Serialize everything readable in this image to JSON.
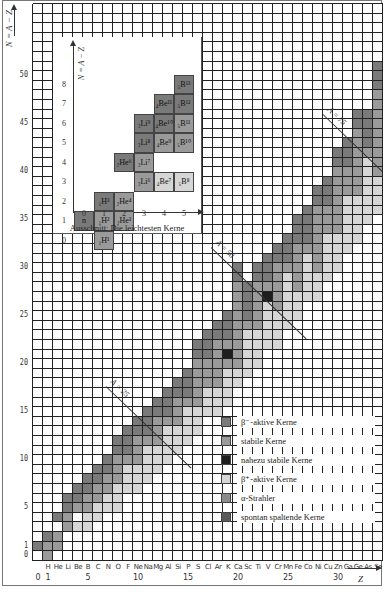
{
  "axes": {
    "y_label": "N = A − Z",
    "x_label": "Z",
    "y_ticks": [
      0,
      1,
      5,
      10,
      15,
      20,
      25,
      30,
      35,
      40,
      45,
      50
    ],
    "x_numbers": [
      0,
      1,
      5,
      10,
      15,
      20,
      25,
      30
    ],
    "x_elements": [
      "",
      "H",
      "He",
      "Li",
      "Be",
      "B",
      "C",
      "N",
      "O",
      "F",
      "Ne",
      "Na",
      "Mg",
      "Al",
      "Si",
      "P",
      "S",
      "Cl",
      "Ar",
      "K",
      "Ca",
      "Sc",
      "Ti",
      "V",
      "Cr",
      "Mn",
      "Fe",
      "Co",
      "Ni",
      "Cu",
      "Zn",
      "Ga",
      "Ge",
      "As",
      "Se"
    ]
  },
  "isobar_lines": [
    {
      "label": "A = 25"
    },
    {
      "label": "A = 50"
    },
    {
      "label": "A = 75"
    }
  ],
  "inset": {
    "caption": "Ausschnitt: Die leichtesten Kerne",
    "y_label": "N = A − Z",
    "x_ticks": [
      0,
      1,
      2,
      3,
      4,
      5
    ],
    "y_ticks": [
      0,
      1,
      2,
      3,
      4,
      5,
      6,
      7,
      8
    ],
    "nuclides": [
      {
        "z": 0,
        "n": 1,
        "label": "n",
        "type": "beta_minus"
      },
      {
        "z": 1,
        "n": 0,
        "label": "₁H¹",
        "type": "stable"
      },
      {
        "z": 1,
        "n": 1,
        "label": "₁H²",
        "type": "stable"
      },
      {
        "z": 1,
        "n": 2,
        "label": "₁H³",
        "type": "beta_minus"
      },
      {
        "z": 2,
        "n": 1,
        "label": "₂He³",
        "type": "stable"
      },
      {
        "z": 2,
        "n": 2,
        "label": "₂He⁴",
        "type": "stable"
      },
      {
        "z": 2,
        "n": 4,
        "label": "₂He⁶",
        "type": "beta_minus"
      },
      {
        "z": 3,
        "n": 3,
        "label": "₃Li⁶",
        "type": "stable"
      },
      {
        "z": 3,
        "n": 4,
        "label": "₃Li⁷",
        "type": "stable"
      },
      {
        "z": 3,
        "n": 5,
        "label": "₃Li⁸",
        "type": "beta_minus"
      },
      {
        "z": 3,
        "n": 6,
        "label": "₃Li⁹",
        "type": "beta_minus"
      },
      {
        "z": 4,
        "n": 3,
        "label": "₄Be⁷",
        "type": "beta_plus"
      },
      {
        "z": 4,
        "n": 5,
        "label": "₄Be⁹",
        "type": "stable"
      },
      {
        "z": 4,
        "n": 6,
        "label": "₄Be¹⁰",
        "type": "beta_minus"
      },
      {
        "z": 4,
        "n": 7,
        "label": "₄Be¹¹",
        "type": "beta_minus"
      },
      {
        "z": 5,
        "n": 3,
        "label": "₅B⁸",
        "type": "beta_plus"
      },
      {
        "z": 5,
        "n": 5,
        "label": "₅B¹⁰",
        "type": "stable"
      },
      {
        "z": 5,
        "n": 6,
        "label": "₅B¹¹",
        "type": "stable"
      },
      {
        "z": 5,
        "n": 7,
        "label": "₅B¹²",
        "type": "beta_minus"
      },
      {
        "z": 5,
        "n": 8,
        "label": "₅B¹³",
        "type": "beta_minus"
      }
    ]
  },
  "legend": [
    {
      "key": "beta_minus",
      "label": "β⁻-aktive Kerne",
      "color": "#7a7a7a"
    },
    {
      "key": "stable",
      "label": "stabile Kerne",
      "color": "#9a9a9a"
    },
    {
      "key": "nearly_stable",
      "label": "nahezu stabile Kerne",
      "color": "#1e1e1e"
    },
    {
      "key": "beta_plus",
      "label": "β⁺-aktive Kerne",
      "color": "#d6d6d6"
    },
    {
      "key": "alpha",
      "label": "α-Strahler",
      "color": "#8c8c8c"
    },
    {
      "key": "fission",
      "label": "spontan spaltende Kerne",
      "color": "#5a5a5a"
    }
  ],
  "chart_data": {
    "type": "heatmap",
    "xlabel": "Z",
    "ylabel": "N = A − Z",
    "xlim": [
      0,
      34
    ],
    "ylim": [
      0,
      57
    ],
    "grid": true,
    "bands": [
      {
        "z": 0,
        "beta_plus": [],
        "stable": [],
        "beta_minus": [
          1,
          1
        ]
      },
      {
        "z": 1,
        "beta_plus": [],
        "stable": [
          0,
          1
        ],
        "beta_minus": [
          2,
          2
        ]
      },
      {
        "z": 2,
        "beta_plus": [],
        "stable": [
          1,
          2
        ],
        "beta_minus": [
          4,
          4
        ]
      },
      {
        "z": 3,
        "beta_plus": [],
        "stable": [
          3,
          4
        ],
        "beta_minus": [
          5,
          6
        ]
      },
      {
        "z": 4,
        "beta_plus": [
          3,
          3
        ],
        "stable": [
          5,
          5
        ],
        "beta_minus": [
          6,
          7
        ]
      },
      {
        "z": 5,
        "beta_plus": [
          3,
          4
        ],
        "stable": [
          5,
          6
        ],
        "beta_minus": [
          7,
          8
        ]
      },
      {
        "z": 6,
        "beta_plus": [
          4,
          5
        ],
        "stable": [
          6,
          7
        ],
        "beta_minus": [
          8,
          9
        ]
      },
      {
        "z": 7,
        "beta_plus": [
          5,
          6
        ],
        "stable": [
          7,
          8
        ],
        "beta_minus": [
          9,
          10
        ]
      },
      {
        "z": 8,
        "beta_plus": [
          5,
          7
        ],
        "stable": [
          8,
          10
        ],
        "beta_minus": [
          11,
          12
        ]
      },
      {
        "z": 9,
        "beta_plus": [
          7,
          9
        ],
        "stable": [
          10,
          10
        ],
        "beta_minus": [
          11,
          13
        ]
      },
      {
        "z": 10,
        "beta_plus": [
          7,
          9
        ],
        "stable": [
          10,
          12
        ],
        "beta_minus": [
          13,
          14
        ]
      },
      {
        "z": 11,
        "beta_plus": [
          8,
          11
        ],
        "stable": [
          12,
          12
        ],
        "beta_minus": [
          13,
          15
        ]
      },
      {
        "z": 12,
        "beta_plus": [
          9,
          11
        ],
        "stable": [
          12,
          14
        ],
        "beta_minus": [
          15,
          16
        ]
      },
      {
        "z": 13,
        "beta_plus": [
          10,
          13
        ],
        "stable": [
          14,
          14
        ],
        "beta_minus": [
          15,
          17
        ]
      },
      {
        "z": 14,
        "beta_plus": [
          11,
          13
        ],
        "stable": [
          14,
          16
        ],
        "beta_minus": [
          17,
          18
        ]
      },
      {
        "z": 15,
        "beta_plus": [
          12,
          15
        ],
        "stable": [
          16,
          16
        ],
        "beta_minus": [
          17,
          19
        ]
      },
      {
        "z": 16,
        "beta_plus": [
          13,
          15
        ],
        "stable": [
          16,
          20
        ],
        "beta_minus": [
          21,
          22
        ]
      },
      {
        "z": 17,
        "beta_plus": [
          15,
          17
        ],
        "stable": [
          18,
          20
        ],
        "beta_minus": [
          21,
          23
        ]
      },
      {
        "z": 18,
        "beta_plus": [
          15,
          17
        ],
        "stable": [
          18,
          22
        ],
        "beta_minus": [
          23,
          24
        ]
      },
      {
        "z": 19,
        "beta_plus": [
          16,
          19
        ],
        "stable": [
          20,
          22
        ],
        "beta_minus": [
          23,
          25
        ]
      },
      {
        "z": 20,
        "beta_plus": [
          18,
          19
        ],
        "stable": [
          20,
          28
        ],
        "beta_minus": [
          29,
          30
        ]
      },
      {
        "z": 21,
        "beta_plus": [
          19,
          23
        ],
        "stable": [
          24,
          24
        ],
        "beta_minus": [
          25,
          28
        ]
      },
      {
        "z": 22,
        "beta_plus": [
          20,
          25
        ],
        "stable": [
          24,
          28
        ],
        "beta_minus": [
          29,
          30
        ]
      },
      {
        "z": 23,
        "beta_plus": [
          22,
          27
        ],
        "stable": [
          27,
          28
        ],
        "beta_minus": [
          29,
          31
        ]
      },
      {
        "z": 24,
        "beta_plus": [
          22,
          27
        ],
        "stable": [
          26,
          30
        ],
        "beta_minus": [
          31,
          32
        ]
      },
      {
        "z": 25,
        "beta_plus": [
          24,
          29
        ],
        "stable": [
          30,
          30
        ],
        "beta_minus": [
          31,
          33
        ]
      },
      {
        "z": 26,
        "beta_plus": [
          25,
          29
        ],
        "stable": [
          28,
          32
        ],
        "beta_minus": [
          33,
          35
        ]
      },
      {
        "z": 27,
        "beta_plus": [
          27,
          31
        ],
        "stable": [
          32,
          32
        ],
        "beta_minus": [
          33,
          36
        ]
      },
      {
        "z": 28,
        "beta_plus": [
          27,
          29
        ],
        "stable": [
          30,
          36
        ],
        "beta_minus": [
          37,
          38
        ]
      },
      {
        "z": 29,
        "beta_plus": [
          29,
          33
        ],
        "stable": [
          34,
          36
        ],
        "beta_minus": [
          37,
          39
        ]
      },
      {
        "z": 30,
        "beta_plus": [
          30,
          33
        ],
        "stable": [
          34,
          40
        ],
        "beta_minus": [
          41,
          42
        ]
      },
      {
        "z": 31,
        "beta_plus": [
          32,
          37
        ],
        "stable": [
          38,
          40
        ],
        "beta_minus": [
          41,
          43
        ]
      },
      {
        "z": 32,
        "beta_plus": [
          33,
          37
        ],
        "stable": [
          38,
          44
        ],
        "beta_minus": [
          45,
          46
        ]
      },
      {
        "z": 33,
        "beta_plus": [
          35,
          41
        ],
        "stable": [
          42,
          42
        ],
        "beta_minus": [
          43,
          46
        ]
      },
      {
        "z": 34,
        "beta_plus": [
          36,
          39
        ],
        "stable": [
          40,
          48
        ],
        "beta_minus": [
          49,
          51
        ]
      }
    ],
    "nearly_stable_cells": [
      {
        "z": 19,
        "n": 21
      },
      {
        "z": 23,
        "n": 27
      }
    ],
    "isobar_lines": [
      25,
      50,
      75
    ]
  }
}
